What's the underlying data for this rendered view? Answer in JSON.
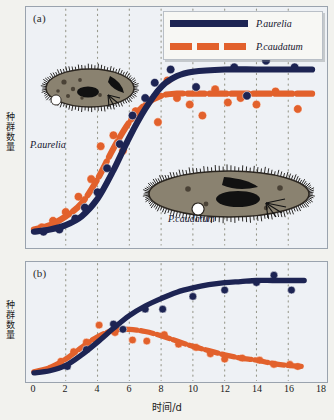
{
  "figure": {
    "panels": [
      {
        "id": "a",
        "label": "(a)"
      },
      {
        "id": "b",
        "label": "(b)"
      }
    ],
    "legend": {
      "entries": [
        {
          "name": "P.aurelia",
          "style": "solid",
          "color": "#1d2453"
        },
        {
          "name": "P.caudatum",
          "style": "dashed",
          "color": "#e2612c"
        }
      ]
    },
    "annotations": [
      {
        "text": "P.aurelia",
        "panel": "a"
      },
      {
        "text": "P.caudatum",
        "panel": "a"
      }
    ],
    "axis": {
      "xlabel": "时间/d",
      "ylabel_chars": [
        "种",
        "群",
        "数",
        "量"
      ],
      "xticks": [
        "0",
        "2",
        "4",
        "6",
        "8",
        "10",
        "12",
        "14",
        "16",
        "18"
      ]
    },
    "colors": {
      "aurelia": "#1d2453",
      "caudatum": "#e2612c",
      "panel_bg": "#eef1f5",
      "page_bg": "#f2f2ee",
      "border": "#9aa3ae",
      "grid": "#8a8a7a",
      "cell_body": "#8a8270"
    }
  },
  "chart_data": [
    {
      "type": "line",
      "panel": "a",
      "title": "(a) Separate cultures",
      "xlabel": "时间/d",
      "ylabel": "种群数量",
      "xlim": [
        0,
        18
      ],
      "ylim": [
        0,
        100
      ],
      "grid": true,
      "legend_position": "top-right",
      "series": [
        {
          "name": "P.aurelia",
          "color": "#1d2453",
          "style": "solid",
          "curve": [
            {
              "x": 0,
              "y": 2
            },
            {
              "x": 1,
              "y": 3
            },
            {
              "x": 2,
              "y": 5
            },
            {
              "x": 3,
              "y": 9
            },
            {
              "x": 4,
              "y": 17
            },
            {
              "x": 5,
              "y": 30
            },
            {
              "x": 6,
              "y": 45
            },
            {
              "x": 7,
              "y": 58
            },
            {
              "x": 8,
              "y": 68
            },
            {
              "x": 9,
              "y": 73
            },
            {
              "x": 10,
              "y": 75
            },
            {
              "x": 12,
              "y": 76
            },
            {
              "x": 14,
              "y": 76
            },
            {
              "x": 16,
              "y": 76
            },
            {
              "x": 17.5,
              "y": 76
            }
          ],
          "points": [
            {
              "x": 0.6,
              "y": 2
            },
            {
              "x": 1.6,
              "y": 3
            },
            {
              "x": 2.6,
              "y": 8
            },
            {
              "x": 3.2,
              "y": 13
            },
            {
              "x": 4.0,
              "y": 20
            },
            {
              "x": 4.6,
              "y": 31
            },
            {
              "x": 5.4,
              "y": 42
            },
            {
              "x": 6.2,
              "y": 55
            },
            {
              "x": 7.0,
              "y": 63
            },
            {
              "x": 7.6,
              "y": 70
            },
            {
              "x": 8.6,
              "y": 76
            },
            {
              "x": 10.2,
              "y": 68
            },
            {
              "x": 11.4,
              "y": 83
            },
            {
              "x": 12.6,
              "y": 77
            },
            {
              "x": 13.4,
              "y": 64
            },
            {
              "x": 14.6,
              "y": 80
            },
            {
              "x": 16.4,
              "y": 77
            }
          ]
        },
        {
          "name": "P.caudatum",
          "color": "#e2612c",
          "style": "dashed",
          "curve": [
            {
              "x": 0,
              "y": 3
            },
            {
              "x": 1,
              "y": 5
            },
            {
              "x": 2,
              "y": 9
            },
            {
              "x": 3,
              "y": 15
            },
            {
              "x": 4,
              "y": 26
            },
            {
              "x": 5,
              "y": 40
            },
            {
              "x": 6,
              "y": 52
            },
            {
              "x": 7,
              "y": 60
            },
            {
              "x": 8,
              "y": 64
            },
            {
              "x": 9,
              "y": 65
            },
            {
              "x": 10,
              "y": 65
            },
            {
              "x": 12,
              "y": 65
            },
            {
              "x": 14,
              "y": 65
            },
            {
              "x": 16,
              "y": 65
            },
            {
              "x": 17.5,
              "y": 65
            }
          ],
          "points": [
            {
              "x": 0.5,
              "y": 4
            },
            {
              "x": 1.2,
              "y": 7
            },
            {
              "x": 2.0,
              "y": 11
            },
            {
              "x": 2.8,
              "y": 18
            },
            {
              "x": 3.6,
              "y": 26
            },
            {
              "x": 4.2,
              "y": 41
            },
            {
              "x": 5.0,
              "y": 46
            },
            {
              "x": 5.6,
              "y": 39
            },
            {
              "x": 6.4,
              "y": 57
            },
            {
              "x": 7.2,
              "y": 62
            },
            {
              "x": 7.8,
              "y": 52
            },
            {
              "x": 8.4,
              "y": 71
            },
            {
              "x": 9.0,
              "y": 63
            },
            {
              "x": 9.8,
              "y": 60
            },
            {
              "x": 10.6,
              "y": 55
            },
            {
              "x": 11.4,
              "y": 67
            },
            {
              "x": 12.2,
              "y": 61
            },
            {
              "x": 13.0,
              "y": 63
            },
            {
              "x": 14.0,
              "y": 60
            },
            {
              "x": 15.2,
              "y": 66
            },
            {
              "x": 16.6,
              "y": 58
            }
          ]
        }
      ]
    },
    {
      "type": "line",
      "panel": "b",
      "title": "(b) Mixed culture",
      "xlabel": "时间/d",
      "ylabel": "种群数量",
      "xlim": [
        0,
        18
      ],
      "ylim": [
        0,
        100
      ],
      "grid": true,
      "series": [
        {
          "name": "P.aurelia",
          "color": "#1d2453",
          "style": "solid",
          "curve": [
            {
              "x": 0,
              "y": 3
            },
            {
              "x": 1,
              "y": 5
            },
            {
              "x": 2,
              "y": 10
            },
            {
              "x": 3,
              "y": 20
            },
            {
              "x": 4,
              "y": 32
            },
            {
              "x": 5,
              "y": 45
            },
            {
              "x": 6,
              "y": 57
            },
            {
              "x": 7,
              "y": 66
            },
            {
              "x": 8,
              "y": 73
            },
            {
              "x": 9,
              "y": 79
            },
            {
              "x": 10,
              "y": 83
            },
            {
              "x": 11,
              "y": 86
            },
            {
              "x": 12,
              "y": 88
            },
            {
              "x": 13,
              "y": 89
            },
            {
              "x": 14,
              "y": 90
            },
            {
              "x": 15,
              "y": 90
            },
            {
              "x": 16,
              "y": 90
            },
            {
              "x": 17,
              "y": 90
            }
          ],
          "points": [
            {
              "x": 2.1,
              "y": 9
            },
            {
              "x": 3.3,
              "y": 25
            },
            {
              "x": 5.0,
              "y": 49
            },
            {
              "x": 5.6,
              "y": 44
            },
            {
              "x": 7.0,
              "y": 63
            },
            {
              "x": 8.1,
              "y": 63
            },
            {
              "x": 10.0,
              "y": 75
            },
            {
              "x": 12.0,
              "y": 81
            },
            {
              "x": 14.0,
              "y": 88
            },
            {
              "x": 15.1,
              "y": 95
            },
            {
              "x": 16.2,
              "y": 81
            }
          ]
        },
        {
          "name": "P.caudatum",
          "color": "#e2612c",
          "style": "dashed",
          "curve": [
            {
              "x": 0,
              "y": 4
            },
            {
              "x": 1,
              "y": 8
            },
            {
              "x": 2,
              "y": 16
            },
            {
              "x": 3,
              "y": 27
            },
            {
              "x": 4,
              "y": 37
            },
            {
              "x": 5,
              "y": 43
            },
            {
              "x": 6,
              "y": 44
            },
            {
              "x": 7,
              "y": 42
            },
            {
              "x": 8,
              "y": 38
            },
            {
              "x": 9,
              "y": 33
            },
            {
              "x": 10,
              "y": 28
            },
            {
              "x": 11,
              "y": 24
            },
            {
              "x": 12,
              "y": 20
            },
            {
              "x": 13,
              "y": 17
            },
            {
              "x": 14,
              "y": 15
            },
            {
              "x": 15,
              "y": 12
            },
            {
              "x": 16,
              "y": 10
            },
            {
              "x": 17,
              "y": 9
            }
          ],
          "points": [
            {
              "x": 1.0,
              "y": 7
            },
            {
              "x": 1.7,
              "y": 14
            },
            {
              "x": 2.5,
              "y": 23
            },
            {
              "x": 3.3,
              "y": 32
            },
            {
              "x": 4.1,
              "y": 48
            },
            {
              "x": 5.1,
              "y": 41
            },
            {
              "x": 6.2,
              "y": 34
            },
            {
              "x": 7.1,
              "y": 33
            },
            {
              "x": 8.2,
              "y": 39
            },
            {
              "x": 9.1,
              "y": 30
            },
            {
              "x": 10.2,
              "y": 27
            },
            {
              "x": 11.1,
              "y": 21
            },
            {
              "x": 12.0,
              "y": 16
            },
            {
              "x": 13.1,
              "y": 17
            },
            {
              "x": 14.2,
              "y": 15
            },
            {
              "x": 15.1,
              "y": 11
            },
            {
              "x": 16.1,
              "y": 11
            },
            {
              "x": 16.6,
              "y": 9
            }
          ]
        }
      ]
    }
  ]
}
